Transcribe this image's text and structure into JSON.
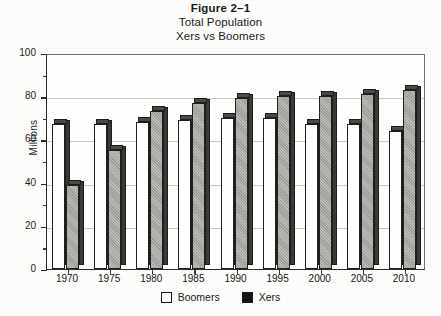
{
  "figure": {
    "label": "Figure 2–1",
    "title": "Total Population",
    "subtitle": "Xers vs Boomers"
  },
  "legend": {
    "items": [
      {
        "label": "Boomers",
        "swatch": "white-square-icon",
        "color": "#ffffff"
      },
      {
        "label": "Xers",
        "swatch": "black-square-icon",
        "color": "#161616"
      }
    ]
  },
  "axes": {
    "ylabel": "Millions",
    "yticks": [
      "0",
      "20",
      "40",
      "60",
      "80",
      "100"
    ],
    "xticks": [
      "1970",
      "1975",
      "1980",
      "1985",
      "1990",
      "1995",
      "2000",
      "2005",
      "2010"
    ]
  },
  "chart_data": {
    "type": "bar",
    "title": "Total Population",
    "subtitle": "Xers vs Boomers",
    "figure_label": "Figure 2–1",
    "xlabel": "",
    "ylabel": "Millions",
    "ylim": [
      0,
      100
    ],
    "ytick_step": 20,
    "yminor_step": 10,
    "grid": true,
    "grid_axis": "y",
    "legend_position": "bottom",
    "three_d": true,
    "categories": [
      "1970",
      "1975",
      "1980",
      "1985",
      "1990",
      "1995",
      "2000",
      "2005",
      "2010"
    ],
    "series": [
      {
        "name": "Boomers",
        "color": "#ffffff",
        "values": [
          67,
          67,
          68,
          69,
          70,
          70,
          67,
          67,
          64
        ]
      },
      {
        "name": "Xers",
        "color": "#9d9d99",
        "values": [
          39,
          55,
          73,
          77,
          79,
          80,
          80,
          81,
          83
        ]
      }
    ]
  }
}
